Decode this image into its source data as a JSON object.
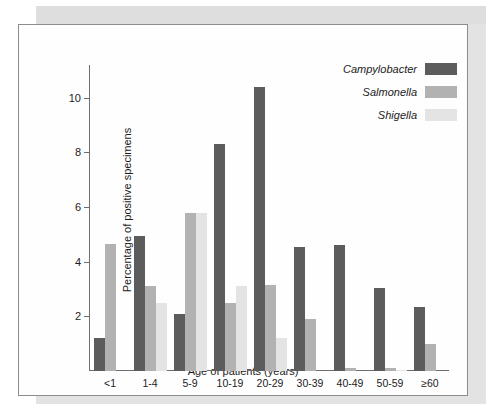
{
  "figure": {
    "background_color": "#fefefe",
    "frame_color": "#8d8d8d"
  },
  "chart_data": {
    "type": "bar",
    "title": "",
    "xlabel": "Age of patients (years)",
    "ylabel": "Percentage of positive specimens",
    "ylim": [
      0,
      11.2
    ],
    "yticks": [
      2,
      4,
      6,
      8,
      10
    ],
    "ytick_labels": [
      "2",
      "4",
      "6",
      "8",
      "10"
    ],
    "grid": false,
    "legend_position": "top-right",
    "categories": [
      "<1",
      "1-4",
      "5-9",
      "10-19",
      "20-29",
      "30-39",
      "40-49",
      "50-59",
      "≥60"
    ],
    "series": [
      {
        "name": "Campylobacter",
        "color": "#5c5c5c",
        "values": [
          1.2,
          4.95,
          2.1,
          8.3,
          10.4,
          4.55,
          4.6,
          3.05,
          2.35
        ]
      },
      {
        "name": "Salmonella",
        "color": "#b2b2b2",
        "values": [
          4.65,
          3.1,
          5.8,
          2.5,
          3.15,
          1.9,
          0.1,
          0.1,
          1.0
        ]
      },
      {
        "name": "Shigella",
        "color": "#e4e4e4",
        "values": [
          0.0,
          2.5,
          5.8,
          3.1,
          1.2,
          0.0,
          0.0,
          0.05,
          0.0
        ]
      }
    ]
  }
}
